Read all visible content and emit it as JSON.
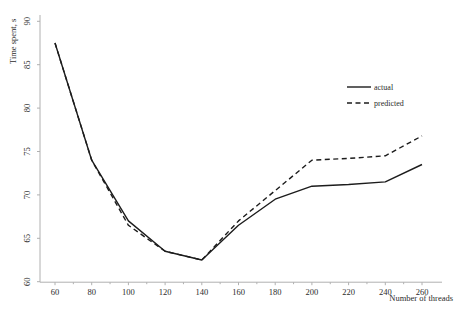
{
  "chart_data": {
    "type": "line",
    "title": "",
    "xlabel": "Number of threads",
    "ylabel": "Time spent, s",
    "x": [
      60,
      80,
      100,
      120,
      140,
      160,
      180,
      200,
      220,
      240,
      260
    ],
    "series": [
      {
        "name": "actual",
        "style": "solid",
        "values": [
          87.5,
          74,
          67,
          63.5,
          62.5,
          66.5,
          69.5,
          71,
          71.2,
          71.5,
          73.5
        ]
      },
      {
        "name": "predicted",
        "style": "dashed",
        "values": [
          87.5,
          74,
          66.5,
          63.5,
          62.5,
          67,
          70.5,
          74,
          74.2,
          74.5,
          76.8
        ]
      }
    ],
    "xticks": [
      60,
      80,
      100,
      120,
      140,
      160,
      180,
      200,
      220,
      240,
      260
    ],
    "yticks": [
      60,
      65,
      70,
      75,
      80,
      85,
      90
    ],
    "xlim": [
      52,
      272
    ],
    "ylim": [
      60,
      90
    ],
    "grid": false,
    "legend_position": "upper-right-inside",
    "colors": {
      "line": "#1c1c1c",
      "axis": "#b0b0b0",
      "text": "#2b2b2b",
      "background": "#ffffff"
    }
  }
}
